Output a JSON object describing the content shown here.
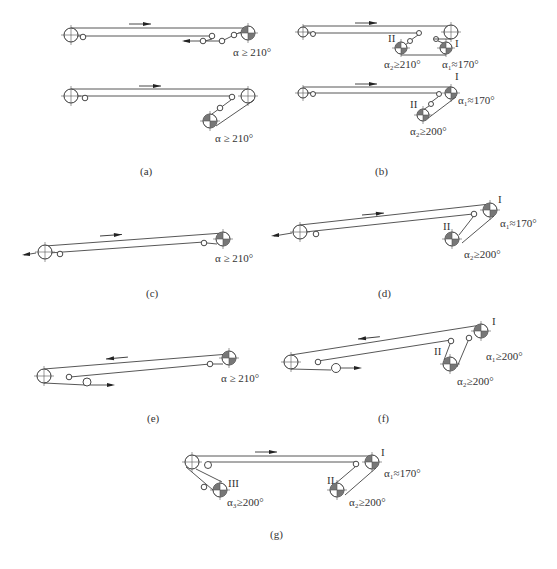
{
  "figure": {
    "panels": [
      {
        "id": "a",
        "caption": "(a)",
        "sub": [
          {
            "angle_label": "α ≥ 210°"
          },
          {
            "angle_label": "α ≥ 210°"
          }
        ]
      },
      {
        "id": "b",
        "caption": "(b)",
        "sub": [
          {
            "drive_I": "I",
            "drive_II": "II",
            "alpha1": "α₁≈170°",
            "alpha2": "α₂≥210°"
          },
          {
            "drive_I": "I",
            "drive_II": "II",
            "alpha1": "α₁≈170°",
            "alpha2": "α₂≥200°"
          }
        ]
      },
      {
        "id": "c",
        "caption": "(c)",
        "angle_label": "α ≥ 210°"
      },
      {
        "id": "d",
        "caption": "(d)",
        "drive_I": "I",
        "drive_II": "II",
        "alpha1": "α₁≈170°",
        "alpha2": "α₂≥200°"
      },
      {
        "id": "e",
        "caption": "(e)",
        "angle_label": "α ≥ 210°"
      },
      {
        "id": "f",
        "caption": "(f)",
        "drive_I": "I",
        "drive_II": "II",
        "alpha1": "α₁≥200°",
        "alpha2": "α₂≥200°"
      },
      {
        "id": "g",
        "caption": "(g)",
        "drive_I": "I",
        "drive_II": "II",
        "drive_III": "III",
        "alpha1": "α₁≈170°",
        "alpha2": "α₂≥200°",
        "alpha3": "α₃≥200°"
      }
    ]
  }
}
